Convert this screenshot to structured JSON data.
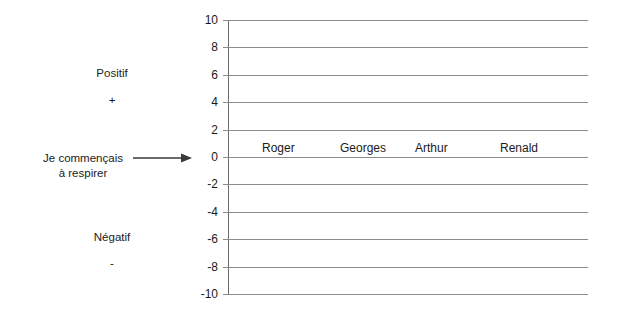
{
  "chart_data": {
    "type": "bar",
    "title": "",
    "subtitle": "",
    "xlabel": "",
    "ylabel": "",
    "categories": [
      "Roger",
      "Georges",
      "Arthur",
      "Renald"
    ],
    "values": [
      0,
      0,
      0,
      0
    ],
    "ylim": [
      -10,
      10
    ],
    "yticks": [
      10,
      8,
      6,
      4,
      2,
      0,
      -2,
      -4,
      -6,
      -8,
      -10
    ],
    "ytick_labels": [
      "10",
      "8",
      "6",
      "4",
      "2",
      "0",
      "-2",
      "-4",
      "-6",
      "-8",
      "-10"
    ],
    "grid": true,
    "legend": false,
    "legend_position": "none",
    "annotations": [
      {
        "id": "positif",
        "text": "Positif",
        "at_value": 6,
        "side": "left"
      },
      {
        "id": "positif_sign",
        "text": "+",
        "at_value": 4,
        "side": "left"
      },
      {
        "id": "breathing_line1",
        "text": "Je commençais",
        "at_value": 0,
        "side": "left"
      },
      {
        "id": "breathing_line2",
        "text": "à respirer",
        "at_value": 0,
        "side": "left"
      },
      {
        "id": "negatif",
        "text": "Négatif",
        "at_value": -6,
        "side": "left"
      },
      {
        "id": "negatif_sign",
        "text": "-",
        "at_value": -8,
        "side": "left"
      }
    ]
  },
  "colors": {
    "background": "#ffffff",
    "gridline": "#8c8c8c",
    "axis": "#6b6b6b",
    "text": "#1a1a1a",
    "arrow": "#3a3a3a"
  },
  "annotations": {
    "positif": "Positif",
    "positif_sign": "+",
    "negatif": "Négatif",
    "negatif_sign": "-",
    "breathing_line1": "Je commençais",
    "breathing_line2": "à respirer",
    "arrow_icon": "arrow-right-icon"
  },
  "axis": {
    "tick_labels": [
      "10",
      "8",
      "6",
      "4",
      "2",
      "0",
      "-2",
      "-4",
      "-6",
      "-8",
      "-10"
    ]
  },
  "categories": [
    "Roger",
    "Georges",
    "Arthur",
    "Renald"
  ]
}
